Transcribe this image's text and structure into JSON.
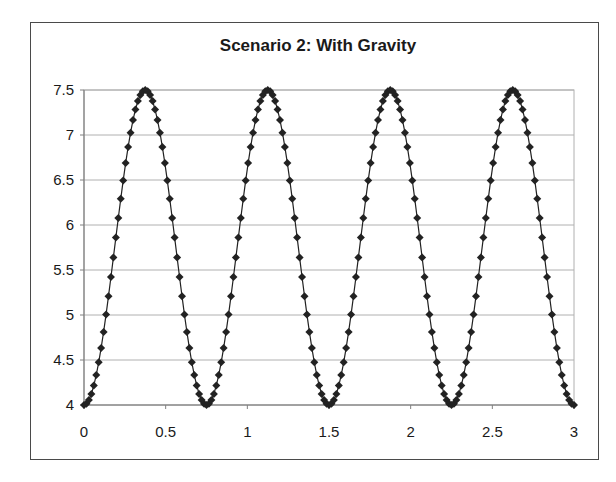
{
  "chart_data": {
    "type": "scatter",
    "title": "Scenario 2: With Gravity",
    "xlabel": "",
    "ylabel": "",
    "xlim": [
      0,
      3
    ],
    "ylim": [
      4,
      7.5
    ],
    "xticks": [
      "0",
      "0.5",
      "1",
      "1.5",
      "2",
      "2.5",
      "3"
    ],
    "xtick_values": [
      0,
      0.5,
      1,
      1.5,
      2,
      2.5,
      3
    ],
    "yticks": [
      "4",
      "4.5",
      "5",
      "5.5",
      "6",
      "6.5",
      "7",
      "7.5"
    ],
    "ytick_values": [
      4,
      4.5,
      5,
      5.5,
      6,
      6.5,
      7,
      7.5
    ],
    "grid": {
      "horizontal": true,
      "vertical": false
    },
    "legend": null,
    "series": [
      {
        "name": "Series1",
        "marker": "diamond",
        "line": true,
        "color": "#222222",
        "model": "y = 5.75 - 1.75*cos(2*pi*x/0.75)",
        "x_start": 0,
        "x_end": 3,
        "x_step": 0.015,
        "amplitude": 1.75,
        "midline": 5.75,
        "period": 0.75,
        "peaks_x": [
          0.375,
          1.125,
          1.875,
          2.625
        ],
        "troughs_x": [
          0,
          0.75,
          1.5,
          2.25,
          3.0
        ],
        "peak_y": 7.5,
        "trough_y": 4
      }
    ]
  },
  "colors": {
    "frame": "#4a4a4a",
    "gridline": "#b0b0b0",
    "axis": "#808080",
    "series": "#222222"
  }
}
